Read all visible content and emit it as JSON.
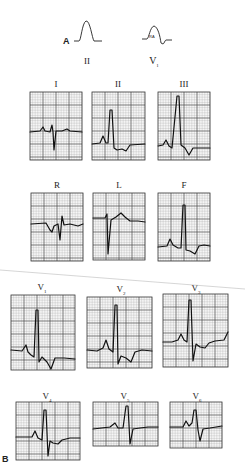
{
  "figure": {
    "panel_a": {
      "letter": "A",
      "waveforms": [
        {
          "lead": "II",
          "inner_label": ""
        },
        {
          "lead": "V",
          "lead_sub": "1",
          "inner_label": "RA"
        }
      ]
    },
    "panel_b": {
      "letter": "B",
      "limb_leads": [
        {
          "id": "I",
          "label": "I"
        },
        {
          "id": "II",
          "label": "II"
        },
        {
          "id": "III",
          "label": "III"
        }
      ],
      "augmented_leads": [
        {
          "id": "R",
          "label": "R"
        },
        {
          "id": "L",
          "label": "L"
        },
        {
          "id": "F",
          "label": "F"
        }
      ],
      "precordial_leads": [
        {
          "id": "V1",
          "label": "V",
          "sub": "1"
        },
        {
          "id": "V2",
          "label": "V",
          "sub": "2"
        },
        {
          "id": "V3",
          "label": "V",
          "sub": "3"
        },
        {
          "id": "V4",
          "label": "V",
          "sub": "4"
        },
        {
          "id": "V5",
          "label": "V",
          "sub": "5"
        },
        {
          "id": "V6",
          "label": "V",
          "sub": "6"
        }
      ]
    }
  }
}
